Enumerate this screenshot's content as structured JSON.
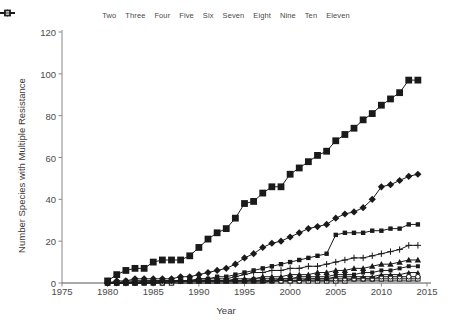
{
  "chart_data": {
    "type": "line",
    "title": "",
    "xlabel": "Year",
    "ylabel": "Number Species with Multiple Resistance",
    "xlim": [
      1975,
      2015
    ],
    "ylim": [
      0,
      120
    ],
    "xticks": [
      1975,
      1980,
      1985,
      1990,
      1995,
      2000,
      2005,
      2010,
      2015
    ],
    "yticks": [
      0,
      20,
      40,
      60,
      80,
      100,
      120
    ],
    "grid": false,
    "legend_position": "top",
    "x": [
      1980,
      1981,
      1982,
      1983,
      1984,
      1985,
      1986,
      1987,
      1988,
      1989,
      1990,
      1991,
      1992,
      1993,
      1994,
      1995,
      1996,
      1997,
      1998,
      1999,
      2000,
      2001,
      2002,
      2003,
      2004,
      2005,
      2006,
      2007,
      2008,
      2009,
      2010,
      2011,
      2012,
      2013,
      2014
    ],
    "series": [
      {
        "name": "Two",
        "marker": "filled-square",
        "values": [
          1,
          4,
          6,
          7,
          7,
          10,
          11,
          11,
          11,
          13,
          17,
          21,
          24,
          26,
          31,
          38,
          39,
          43,
          46,
          46,
          52,
          55,
          58,
          61,
          63,
          68,
          71,
          74,
          78,
          81,
          85,
          88,
          91,
          97,
          97
        ]
      },
      {
        "name": "Three",
        "marker": "filled-diamond",
        "values": [
          0,
          1,
          1,
          2,
          2,
          2,
          2,
          2,
          3,
          3,
          4,
          5,
          6,
          7,
          9,
          12,
          14,
          17,
          19,
          20,
          22,
          24,
          26,
          27,
          28,
          31,
          33,
          34,
          36,
          40,
          46,
          47,
          49,
          51,
          52
        ]
      },
      {
        "name": "Four",
        "marker": "small-filled-square",
        "values": [
          0,
          0,
          1,
          1,
          1,
          1,
          1,
          1,
          1,
          1,
          2,
          2,
          3,
          3,
          4,
          5,
          6,
          7,
          8,
          9,
          10,
          11,
          12,
          13,
          14,
          23,
          24,
          24,
          24,
          25,
          25,
          26,
          26,
          28,
          28
        ]
      },
      {
        "name": "Five",
        "marker": "plus",
        "values": [
          0,
          0,
          0,
          1,
          1,
          1,
          1,
          1,
          1,
          1,
          2,
          2,
          2,
          2,
          3,
          4,
          5,
          5,
          6,
          6,
          7,
          7,
          8,
          8,
          9,
          10,
          11,
          12,
          12,
          13,
          14,
          15,
          16,
          18,
          18
        ]
      },
      {
        "name": "Six",
        "marker": "filled-triangle",
        "values": [
          0,
          0,
          0,
          0,
          1,
          1,
          1,
          1,
          1,
          1,
          1,
          1,
          1,
          1,
          2,
          2,
          2,
          3,
          3,
          3,
          4,
          4,
          4,
          5,
          5,
          6,
          6,
          7,
          7,
          8,
          9,
          9,
          10,
          11,
          11
        ]
      },
      {
        "name": "Seven",
        "marker": "small-square-b",
        "values": [
          0,
          0,
          0,
          0,
          0,
          1,
          1,
          1,
          1,
          1,
          1,
          1,
          1,
          1,
          1,
          1,
          2,
          2,
          2,
          2,
          2,
          3,
          3,
          3,
          3,
          4,
          4,
          4,
          5,
          5,
          6,
          6,
          7,
          8,
          8
        ]
      },
      {
        "name": "Eight",
        "marker": "small-triangle-b",
        "values": [
          0,
          0,
          0,
          0,
          0,
          0,
          1,
          1,
          1,
          1,
          1,
          1,
          1,
          1,
          1,
          1,
          1,
          1,
          1,
          2,
          2,
          2,
          2,
          2,
          2,
          3,
          3,
          3,
          3,
          3,
          4,
          4,
          4,
          5,
          5
        ]
      },
      {
        "name": "Nine",
        "marker": "open-circle",
        "values": [
          0,
          0,
          0,
          0,
          0,
          0,
          0,
          1,
          1,
          1,
          1,
          1,
          1,
          1,
          1,
          1,
          1,
          1,
          1,
          1,
          1,
          1,
          2,
          2,
          2,
          2,
          2,
          2,
          2,
          2,
          3,
          3,
          3,
          3,
          3
        ]
      },
      {
        "name": "Ten",
        "marker": "open-square",
        "values": [
          0,
          0,
          0,
          0,
          0,
          0,
          0,
          0,
          1,
          1,
          1,
          1,
          1,
          1,
          1,
          1,
          1,
          1,
          1,
          1,
          1,
          1,
          1,
          1,
          1,
          1,
          1,
          2,
          2,
          2,
          2,
          2,
          2,
          2,
          2
        ]
      },
      {
        "name": "Eleven",
        "marker": "line-only",
        "values": [
          0,
          0,
          0,
          0,
          0,
          0,
          0,
          0,
          0,
          0,
          0,
          0,
          0,
          0,
          0,
          0,
          0,
          0,
          1,
          1,
          1,
          1,
          1,
          1,
          1,
          1,
          1,
          1,
          1,
          1,
          1,
          1,
          1,
          1,
          1
        ]
      }
    ],
    "color": "#1a1a1a"
  }
}
